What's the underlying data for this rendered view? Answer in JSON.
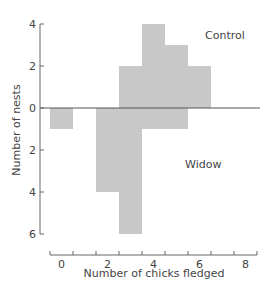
{
  "chart_data": {
    "type": "bar",
    "title": "",
    "xlabel": "Number of chicks fledged",
    "ylabel": "Number of nests",
    "x": [
      0,
      1,
      2,
      3,
      4,
      5,
      6,
      7,
      8
    ],
    "x_tick_labels": [
      "0",
      "2",
      "4",
      "6",
      "8"
    ],
    "y_tick_labels_up": [
      "0",
      "2",
      "4"
    ],
    "y_tick_labels_down": [
      "2",
      "4",
      "6"
    ],
    "ylim": [
      -6,
      4
    ],
    "grid": false,
    "layout": "back-to-back histogram: Control above zero line, Widow below",
    "series": [
      {
        "name": "Control",
        "direction": "up",
        "values": [
          0,
          0,
          0,
          2,
          4,
          3,
          2,
          0,
          0
        ]
      },
      {
        "name": "Widow",
        "direction": "down",
        "values": [
          1,
          0,
          4,
          6,
          1,
          1,
          0,
          0,
          0
        ]
      }
    ],
    "annotations": [
      "Control",
      "Widow"
    ],
    "bar_color": "#c8c8c8"
  }
}
